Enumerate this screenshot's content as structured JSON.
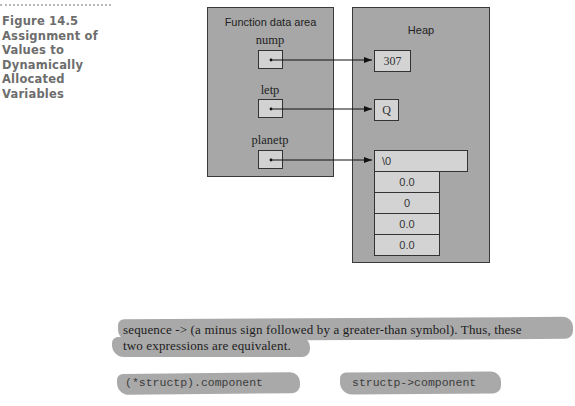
{
  "figure": {
    "caption_lines": [
      "Figure 14.5",
      "Assignment of",
      "Values to",
      "Dynamically",
      "Allocated",
      "Variables"
    ]
  },
  "diagram": {
    "function_area": {
      "title": "Function data area",
      "variables": [
        {
          "name": "nump"
        },
        {
          "name": "letp"
        },
        {
          "name": "planetp"
        }
      ]
    },
    "heap": {
      "title": "Heap",
      "int_value": "307",
      "char_value": "Q",
      "struct_cells": [
        "\\0",
        "0.0",
        "0",
        "0.0",
        "0.0"
      ]
    },
    "colors": {
      "panel_fill": "#a7a7a7",
      "cell_fill": "#d3d3d3",
      "border": "#333333"
    }
  },
  "body": {
    "line1": "sequence -> (a minus sign followed by a greater-than symbol). Thus, these",
    "line2": "two expressions are equivalent.",
    "expr_left": "(*structp).component",
    "expr_right": "structp->component"
  }
}
